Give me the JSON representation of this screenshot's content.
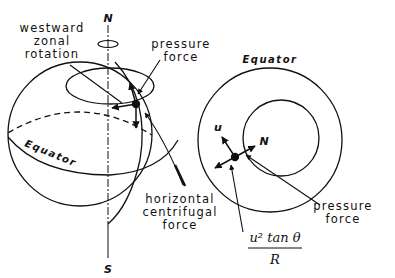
{
  "left_globe": {
    "north_label": "N",
    "south_label": "S",
    "equator_label": "Equator",
    "rotation_label_lines": [
      "westward",
      "zonal",
      "rotation"
    ],
    "pressure_label_lines": [
      "pressure",
      "force"
    ],
    "centrifugal_label_lines": [
      "horizontal",
      "centrifugal",
      "force"
    ]
  },
  "right_disk": {
    "equator_label": "Equator",
    "u_label": "u",
    "n_label": "N",
    "pressure_label_lines": [
      "pressure",
      "force"
    ],
    "formula_numerator": "u² tan θ",
    "formula_denominator": "R"
  }
}
